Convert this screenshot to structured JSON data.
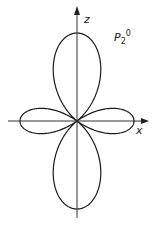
{
  "diagram": {
    "title": "P",
    "title_sub": "2",
    "title_sup": "0",
    "axis_z_label": "z",
    "axis_x_label": "x",
    "colors": {
      "stroke": "#1a1a1a",
      "background": "#ffffff"
    }
  },
  "chart_data": {
    "type": "polar",
    "function": "|3cos²θ − 1| / 2",
    "xlabel": "x",
    "ylabel": "z",
    "origin_px": [
      77,
      121
    ],
    "z_lobe_radius_px": 88,
    "x_lobe_radius_px": 57
  }
}
